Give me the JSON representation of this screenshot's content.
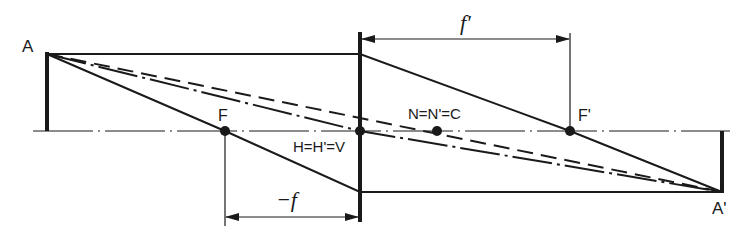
{
  "diagram": {
    "colors": {
      "ink": "#1a1a1a",
      "background": "#ffffff"
    },
    "labels": {
      "object_point": "A",
      "image_point": "A'",
      "front_focal_point": "F",
      "back_focal_point": "F'",
      "principal_points": "H=H'=V",
      "nodal_points": "N=N'=C",
      "back_focal_length": "f'",
      "front_focal_length": "−f"
    },
    "elements": {
      "optical_axis": {
        "style": "dash-dot",
        "from": [
          33,
          131
        ],
        "to": [
          730,
          131
        ]
      },
      "lens": {
        "x": 360,
        "top": 32,
        "bottom": 222
      },
      "object": {
        "x": 47,
        "top": 54,
        "bottom": 131
      },
      "image": {
        "x": 722,
        "top": 131,
        "bottom": 192
      },
      "points": {
        "F": [
          225,
          131
        ],
        "H": [
          360,
          131
        ],
        "N": [
          437,
          131
        ],
        "F_prime": [
          570,
          131
        ]
      },
      "rays": [
        {
          "name": "parallel-ray",
          "style": "solid",
          "path": [
            [
              47,
              54
            ],
            [
              360,
              54
            ],
            [
              570,
              131
            ],
            [
              722,
              192
            ]
          ]
        },
        {
          "name": "focal-ray",
          "style": "solid",
          "path": [
            [
              47,
              54
            ],
            [
              225,
              131
            ],
            [
              360,
              192
            ],
            [
              722,
              192
            ]
          ]
        },
        {
          "name": "nodal-ray",
          "style": "dashed",
          "path": [
            [
              47,
              54
            ],
            [
              722,
              192
            ]
          ]
        },
        {
          "name": "principal-ray",
          "style": "dash-dot",
          "path": [
            [
              47,
              54
            ],
            [
              360,
              131
            ],
            [
              722,
              192
            ]
          ]
        }
      ],
      "dimensions": {
        "f_prime": {
          "y": 39,
          "from_x": 360,
          "to_x": 570
        },
        "minus_f": {
          "y": 217,
          "from_x": 225,
          "to_x": 360
        }
      }
    }
  }
}
